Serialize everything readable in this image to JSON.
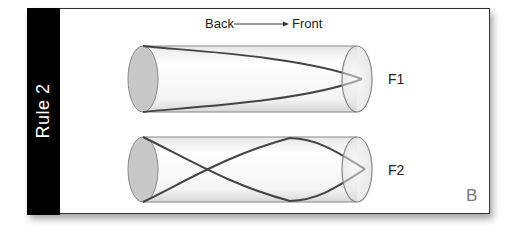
{
  "panel": {
    "side_label": "Rule 2",
    "direction": {
      "back": "Back",
      "front": "Front"
    },
    "corner_label": "B"
  },
  "figures": [
    {
      "id": "F1",
      "label": "F1",
      "description": "Cone-shaped line pattern converging from back to a point at front"
    },
    {
      "id": "F2",
      "label": "F2",
      "description": "Crossing sinusoidal lines forming X then lens shape converging at front"
    }
  ],
  "colors": {
    "sidebar": "#000000",
    "line": "#444444",
    "cylinder_end": "#c8c8c8",
    "border": "#333333"
  }
}
